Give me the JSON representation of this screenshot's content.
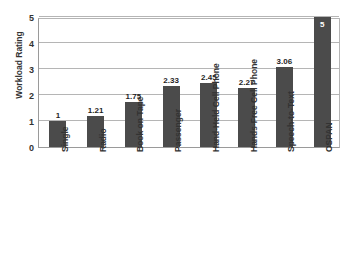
{
  "chart_data": {
    "type": "bar",
    "title": "",
    "xlabel": "",
    "ylabel": "Workload Rating",
    "ylim": [
      0,
      5
    ],
    "yticks": [
      "5",
      "4",
      "3",
      "2",
      "1",
      "0"
    ],
    "grid": true,
    "legend": "none",
    "bar_color": "#4b4b4b",
    "categories": [
      "Single",
      "Radio",
      "Book on Tape",
      "Passenger",
      "Hand-Held Cell Phone",
      "Hands-Free Cell Phone",
      "Speech-to-Text",
      "OSPAN"
    ],
    "values": [
      1,
      1.21,
      1.75,
      2.33,
      2.45,
      2.27,
      3.06,
      5
    ],
    "value_labels": [
      "1",
      "1.21",
      "1.75",
      "2.33",
      "2.45",
      "2.27",
      "3.06",
      "5"
    ]
  }
}
